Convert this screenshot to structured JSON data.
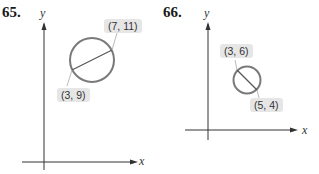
{
  "problems": [
    {
      "number": "65.",
      "axes": {
        "x_label": "x",
        "y_label": "y"
      },
      "endpoints": [
        {
          "label": "(7, 11)",
          "x": 7,
          "y": 11
        },
        {
          "label": "(3, 9)",
          "x": 3,
          "y": 9
        }
      ]
    },
    {
      "number": "66.",
      "axes": {
        "x_label": "x",
        "y_label": "y"
      },
      "endpoints": [
        {
          "label": "(3, 6)",
          "x": 3,
          "y": 6
        },
        {
          "label": "(5, 4)",
          "x": 5,
          "y": 4
        }
      ]
    }
  ],
  "colors": {
    "circle": "#7a7a7a",
    "axis": "#333333",
    "label_bg": "#e6e6e6"
  }
}
